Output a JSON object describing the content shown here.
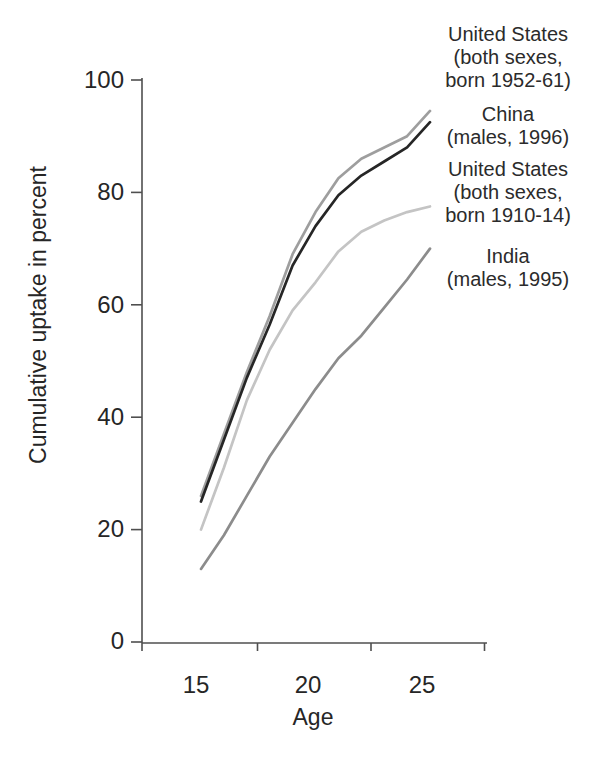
{
  "figure": {
    "background": "#ffffff",
    "text_color": "#262626",
    "axis_color": "#4f4f4f"
  },
  "legend": {
    "items": [
      {
        "lines": [
          "United States",
          "(both sexes,",
          "born 1952-61)"
        ]
      },
      {
        "lines": [
          "China",
          "(males, 1996)"
        ]
      },
      {
        "lines": [
          "United States",
          "(both sexes,",
          "born 1910-14)"
        ]
      },
      {
        "lines": [
          "India",
          "(males, 1995)"
        ]
      }
    ]
  },
  "chart_data": {
    "type": "line",
    "title": "",
    "xlabel": "Age",
    "ylabel": "Cumulative uptake in percent",
    "x": [
      15,
      16,
      17,
      18,
      19,
      20,
      21,
      22,
      23,
      24,
      25
    ],
    "x_tick_labels": [
      15,
      20,
      25
    ],
    "y_tick_labels": [
      0,
      20,
      40,
      60,
      80,
      100
    ],
    "ylim": [
      0,
      100
    ],
    "grid": false,
    "legend_position": "right",
    "series": [
      {
        "name": "United States (both sexes, born 1952-61)",
        "color": "#9e9e9e",
        "values": [
          26,
          37,
          48,
          58,
          69,
          76.5,
          82.5,
          86,
          88,
          90,
          94.5
        ]
      },
      {
        "name": "China (males, 1996)",
        "color": "#262626",
        "values": [
          25,
          36,
          47,
          56.5,
          67,
          74,
          79.5,
          83,
          85.5,
          88,
          92.5
        ]
      },
      {
        "name": "United States (both sexes, born 1910-14)",
        "color": "#c4c4c4",
        "values": [
          20,
          31,
          43,
          52,
          59,
          64,
          69.5,
          73,
          75,
          76.5,
          77.5
        ]
      },
      {
        "name": "India (males, 1995)",
        "color": "#8c8c8c",
        "values": [
          13,
          19,
          26,
          33,
          39,
          45,
          50.5,
          54.5,
          59.5,
          64.5,
          70
        ]
      }
    ]
  }
}
